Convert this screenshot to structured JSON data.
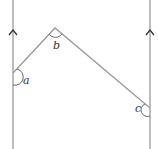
{
  "diagram": {
    "labels": {
      "a": "a",
      "b": "b",
      "c": "c"
    },
    "colors": {
      "line": "#9a9a9a",
      "arc": "#555555",
      "arrow": "#333333"
    }
  }
}
